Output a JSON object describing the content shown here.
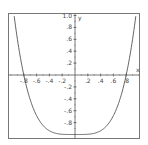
{
  "chart_data": {
    "type": "line",
    "title": "",
    "xlabel": "x",
    "ylabel": "y",
    "xlim": [
      -1.0,
      1.0
    ],
    "ylim": [
      -1.0,
      1.0
    ],
    "grid": false,
    "x_ticks": [
      "-.8",
      "-.6",
      "-.4",
      "-.2",
      ".2",
      ".4",
      ".6",
      ".8"
    ],
    "x_tick_values": [
      -0.8,
      -0.6,
      -0.4,
      -0.2,
      0.2,
      0.4,
      0.6,
      0.8
    ],
    "y_ticks": [
      "1.0",
      ".8",
      ".6",
      ".4",
      ".2",
      "-.2",
      "-.4",
      "-.6",
      "-.8"
    ],
    "y_tick_values": [
      1.0,
      0.8,
      0.6,
      0.4,
      0.2,
      -0.2,
      -0.4,
      -0.6,
      -0.8
    ],
    "series": [
      {
        "name": "curve",
        "color": "#555555",
        "x": [
          -1.0,
          -0.9,
          -0.8,
          -0.7,
          -0.6,
          -0.5,
          -0.4,
          -0.3,
          -0.2,
          -0.1,
          0.0,
          0.1,
          0.2,
          0.3,
          0.4,
          0.5,
          0.6,
          0.7,
          0.8,
          0.9,
          1.0
        ],
        "y": [
          1.0,
          0.6,
          0.0,
          -0.41,
          -0.68,
          -0.85,
          -0.94,
          -0.98,
          -1.0,
          -1.0,
          -1.0,
          -1.0,
          -1.0,
          -0.98,
          -0.94,
          -0.85,
          -0.68,
          -0.41,
          0.0,
          0.6,
          1.0
        ]
      }
    ],
    "roots": [
      -0.8,
      0.8
    ],
    "minimum": {
      "x": 0,
      "y": -1.0
    }
  }
}
